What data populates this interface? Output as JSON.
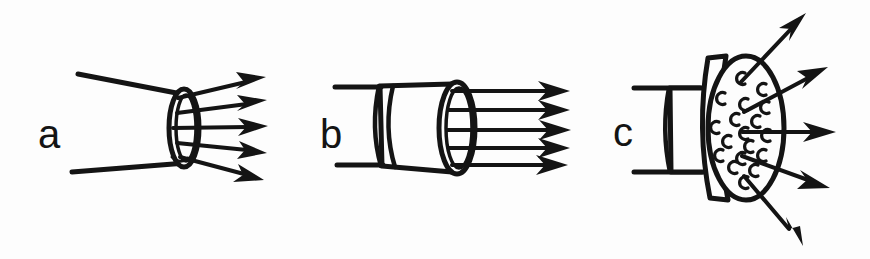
{
  "figure": {
    "background_color": "#fdfdfd",
    "ink_color": "#141414",
    "width": 870,
    "height": 259
  },
  "panels": [
    {
      "id": "a",
      "label": "a",
      "label_x": 38,
      "label_y": 148,
      "label_size": 40,
      "description": "converging taper to narrow ring outlet with five diverging straight flow arrows",
      "arrow_count": 5,
      "outlet_shape": "narrow-ellipse-ring",
      "duct_style": "two-converging-lines",
      "arrows": [
        {
          "x1": 178,
          "y1": 98,
          "x2": 261,
          "y2": 78
        },
        {
          "x1": 177,
          "y1": 113,
          "x2": 262,
          "y2": 101
        },
        {
          "x1": 173,
          "y1": 128,
          "x2": 263,
          "y2": 126
        },
        {
          "x1": 177,
          "y1": 143,
          "x2": 262,
          "y2": 151
        },
        {
          "x1": 180,
          "y1": 157,
          "x2": 259,
          "y2": 176
        }
      ],
      "taper_lines": [
        {
          "x1": 78,
          "y1": 74,
          "x2": 192,
          "y2": 96
        },
        {
          "x1": 72,
          "y1": 172,
          "x2": 186,
          "y2": 163
        }
      ],
      "outlet_ellipse": {
        "cx": 184,
        "cy": 128,
        "rx": 14,
        "ry": 38
      }
    },
    {
      "id": "b",
      "label": "b",
      "label_x": 320,
      "label_y": 148,
      "label_size": 40,
      "description": "diverging conical nozzle with collar and five parallel flow arrows",
      "arrow_count": 5,
      "outlet_shape": "wide-ellipse-ring",
      "duct_style": "cone-with-collar",
      "arrows": [
        {
          "x1": 480,
          "y1": 91,
          "x2": 565,
          "y2": 91
        },
        {
          "x1": 483,
          "y1": 110,
          "x2": 565,
          "y2": 110
        },
        {
          "x1": 487,
          "y1": 130,
          "x2": 566,
          "y2": 130
        },
        {
          "x1": 484,
          "y1": 148,
          "x2": 565,
          "y2": 148
        },
        {
          "x1": 478,
          "y1": 165,
          "x2": 563,
          "y2": 165
        }
      ],
      "outlet_ellipse": {
        "cx": 457,
        "cy": 128,
        "rx": 17,
        "ry": 45
      },
      "collar_x": 375,
      "pipe_lines": [
        {
          "x1": 335,
          "y1": 87,
          "x2": 380,
          "y2": 87
        },
        {
          "x1": 337,
          "y1": 165,
          "x2": 382,
          "y2": 165
        }
      ]
    },
    {
      "id": "c",
      "label": "c",
      "label_x": 613,
      "label_y": 146,
      "label_size": 40,
      "description": "pipe terminating in a perforated disk plate with five arrows radiating outward",
      "arrow_count": 5,
      "outlet_shape": "perforated-disk",
      "duct_style": "cylinder-with-plate",
      "hole_count": 18,
      "arrows": [
        {
          "x1": 748,
          "y1": 88,
          "x2": 800,
          "y2": 18
        },
        {
          "x1": 746,
          "y1": 119,
          "x2": 818,
          "y2": 72
        },
        {
          "x1": 755,
          "y1": 132,
          "x2": 832,
          "y2": 132
        },
        {
          "x1": 744,
          "y1": 160,
          "x2": 824,
          "y2": 186
        },
        {
          "x1": 747,
          "y1": 180,
          "x2": 800,
          "y2": 243
        }
      ],
      "disk_ellipse": {
        "cx": 746,
        "cy": 128,
        "rx": 38,
        "ry": 72
      },
      "holes": [
        {
          "cx": 742,
          "cy": 78
        },
        {
          "cx": 763,
          "cy": 89
        },
        {
          "cx": 722,
          "cy": 98
        },
        {
          "cx": 745,
          "cy": 104
        },
        {
          "cx": 766,
          "cy": 107
        },
        {
          "cx": 736,
          "cy": 119
        },
        {
          "cx": 757,
          "cy": 121
        },
        {
          "cx": 716,
          "cy": 127
        },
        {
          "cx": 745,
          "cy": 133
        },
        {
          "cx": 767,
          "cy": 135
        },
        {
          "cx": 728,
          "cy": 141
        },
        {
          "cx": 750,
          "cy": 146
        },
        {
          "cx": 720,
          "cy": 155
        },
        {
          "cx": 742,
          "cy": 158
        },
        {
          "cx": 763,
          "cy": 155
        },
        {
          "cx": 734,
          "cy": 167
        },
        {
          "cx": 755,
          "cy": 170
        },
        {
          "cx": 745,
          "cy": 182
        }
      ],
      "pipe_lines": [
        {
          "x1": 634,
          "y1": 88,
          "x2": 700,
          "y2": 88
        },
        {
          "x1": 634,
          "y1": 172,
          "x2": 702,
          "y2": 172
        }
      ]
    }
  ]
}
